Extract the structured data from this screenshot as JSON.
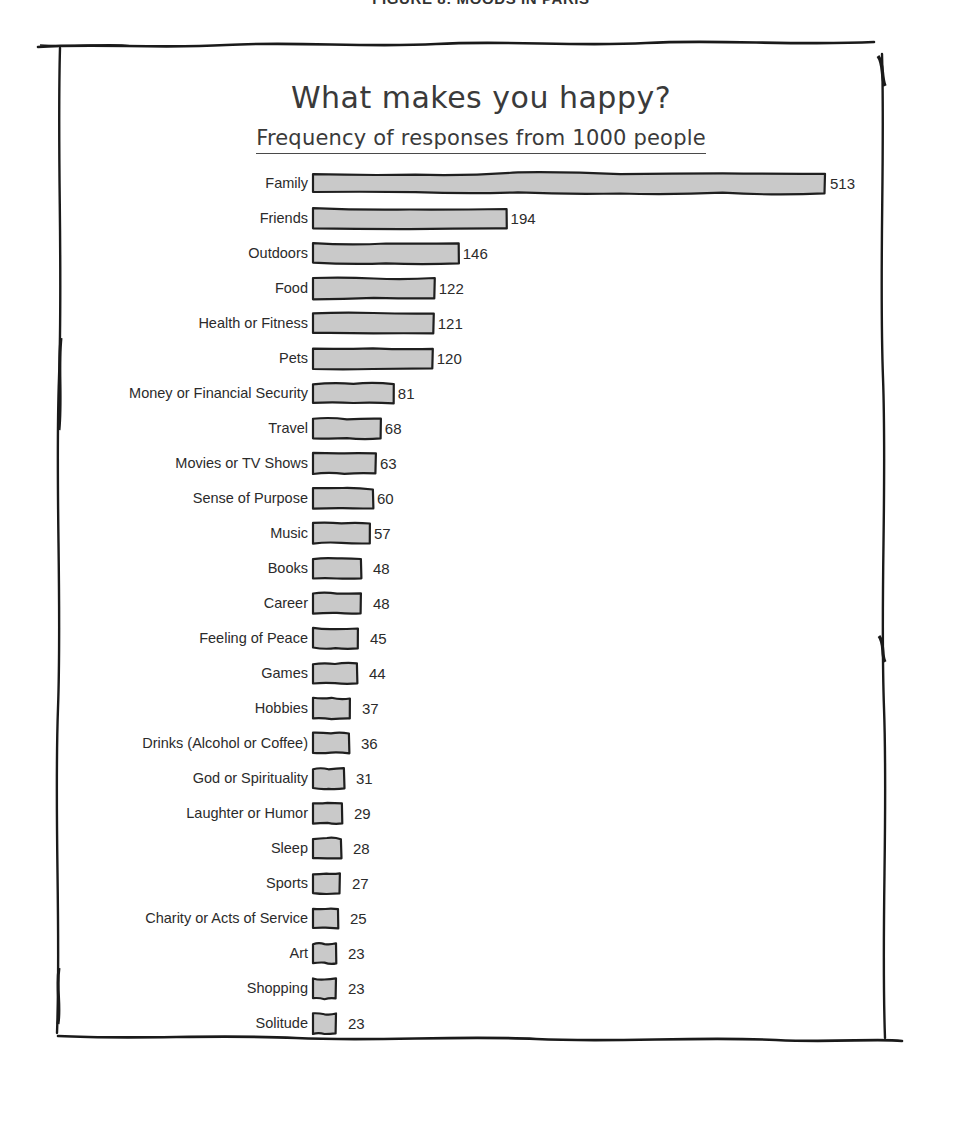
{
  "running_header": {
    "text": "FIGURE 8: MOODS IN PARIS"
  },
  "figure": {
    "title": "What makes you happy?",
    "subtitle": "Frequency of responses from 1000 people",
    "frame_style": "hand-drawn-sketch-border",
    "border_color": "#1a1a1a",
    "background_color": "#ffffff"
  },
  "chart_data": {
    "type": "bar",
    "orientation": "horizontal",
    "title": "What makes you happy?",
    "subtitle": "Frequency of responses from 1000 people",
    "xlabel": "",
    "ylabel": "",
    "xlim": [
      0,
      513
    ],
    "grid": false,
    "legend": null,
    "bar_fill_color": "#c9c9c9",
    "bar_edge_color": "#1f1f1f",
    "data_labels": true,
    "style": "xkcd-handdrawn",
    "categories": [
      "Family",
      "Friends",
      "Outdoors",
      "Food",
      "Health or Fitness",
      "Pets",
      "Money or Financial Security",
      "Travel",
      "Movies or TV Shows",
      "Sense of Purpose",
      "Music",
      "Books",
      "Career",
      "Feeling of Peace",
      "Games",
      "Hobbies",
      "Drinks (Alcohol or Coffee)",
      "God or Spirituality",
      "Laughter or Humor",
      "Sleep",
      "Sports",
      "Charity or Acts of Service",
      "Art",
      "Shopping",
      "Solitude"
    ],
    "values": [
      513,
      194,
      146,
      122,
      121,
      120,
      81,
      68,
      63,
      60,
      57,
      48,
      48,
      45,
      44,
      37,
      36,
      31,
      29,
      28,
      27,
      25,
      23,
      23,
      23
    ],
    "rows": [
      {
        "label": "Family",
        "value": 513
      },
      {
        "label": "Friends",
        "value": 194
      },
      {
        "label": "Outdoors",
        "value": 146
      },
      {
        "label": "Food",
        "value": 122
      },
      {
        "label": "Health or Fitness",
        "value": 121
      },
      {
        "label": "Pets",
        "value": 120
      },
      {
        "label": "Money or Financial Security",
        "value": 81
      },
      {
        "label": "Travel",
        "value": 68
      },
      {
        "label": "Movies or TV Shows",
        "value": 63
      },
      {
        "label": "Sense of Purpose",
        "value": 60
      },
      {
        "label": "Music",
        "value": 57
      },
      {
        "label": "Books",
        "value": 48
      },
      {
        "label": "Career",
        "value": 48
      },
      {
        "label": "Feeling of Peace",
        "value": 45
      },
      {
        "label": "Games",
        "value": 44
      },
      {
        "label": "Hobbies",
        "value": 37
      },
      {
        "label": "Drinks (Alcohol or Coffee)",
        "value": 36
      },
      {
        "label": "God or Spirituality",
        "value": 31
      },
      {
        "label": "Laughter or Humor",
        "value": 29
      },
      {
        "label": "Sleep",
        "value": 28
      },
      {
        "label": "Sports",
        "value": 27
      },
      {
        "label": "Charity or Acts of Service",
        "value": 25
      },
      {
        "label": "Art",
        "value": 23
      },
      {
        "label": "Shopping",
        "value": 23
      },
      {
        "label": "Solitude",
        "value": 23
      }
    ]
  }
}
